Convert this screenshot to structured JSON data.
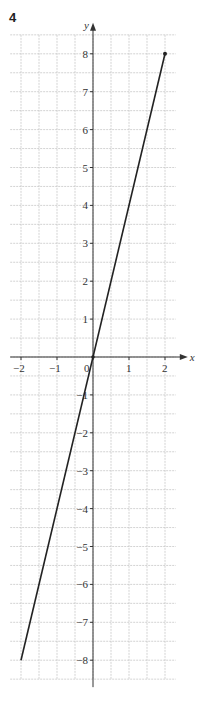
{
  "question_number": "4",
  "chart_data": {
    "type": "line",
    "title": "",
    "xlabel": "x",
    "ylabel": "y",
    "xlim": [
      -2.3,
      2.3
    ],
    "ylim": [
      -8.5,
      8.5
    ],
    "grid": true,
    "grid_step": 0.5,
    "x_ticks": [
      -2,
      -1,
      0,
      1,
      2
    ],
    "x_tick_labels": [
      "−2",
      "−1",
      "0",
      "1",
      "2"
    ],
    "y_ticks": [
      -8,
      -7,
      -6,
      -5,
      -4,
      -3,
      -2,
      -1,
      1,
      2,
      3,
      4,
      5,
      6,
      7,
      8
    ],
    "y_tick_labels": [
      "−8",
      "−7",
      "−6",
      "−5",
      "−4",
      "−3",
      "−2",
      "−1",
      "1",
      "2",
      "3",
      "4",
      "5",
      "6",
      "7",
      "8"
    ],
    "series": [
      {
        "name": "y = 4x",
        "x": [
          -2,
          2
        ],
        "values": [
          -8,
          8
        ],
        "end_markers": [
          false,
          true
        ]
      }
    ],
    "legend": "none"
  }
}
